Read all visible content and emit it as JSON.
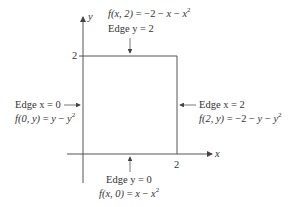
{
  "axes": {
    "x_label": "x",
    "y_label": "y",
    "x_tick": "2",
    "y_tick": "2"
  },
  "edges": {
    "top": {
      "name": "Edge y = 2",
      "func_lhs": "f(x, 2)",
      "func_rhs_a": " = −2 − ",
      "func_x": "x",
      "func_rhs_b": " − ",
      "func_sq": "x",
      "exp": "2"
    },
    "left": {
      "name": "Edge x = 0",
      "func_lhs": "f(0, y)",
      "func_rhs_a": " = ",
      "func_y": "y",
      "func_rhs_b": " − ",
      "func_sq": "y",
      "exp": "2"
    },
    "right": {
      "name": "Edge x = 2",
      "func_lhs": "f(2, y)",
      "func_rhs_a": " = −2 − ",
      "func_y": "y",
      "func_rhs_b": " − ",
      "func_sq": "y",
      "exp": "2"
    },
    "bottom": {
      "name": "Edge y = 0",
      "func_lhs": "f(x, 0)",
      "func_rhs_a": " = ",
      "func_x": "x",
      "func_rhs_b": " − ",
      "func_sq": "x",
      "exp": "2"
    }
  },
  "colors": {
    "line": "#555555",
    "text": "#333333"
  }
}
